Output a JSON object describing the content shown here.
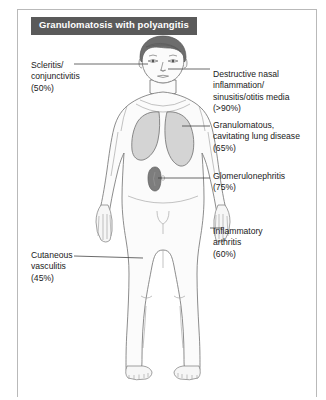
{
  "figure": {
    "title": "Granulomatosis with polyangitis",
    "accent_color": "#5a5a5a",
    "frame_color": "#b9b9b9",
    "background_color": "#ffffff"
  },
  "anatomy": {
    "figure_type": "anterior-human-body-outline",
    "skin_color": "#fbfbfb",
    "outline_color": "#6e6e6e",
    "hair_color": "#6b6b6b",
    "organs": [
      {
        "name": "lungs",
        "fill": "#d6d6d6",
        "stroke": "#6e6e6e"
      },
      {
        "name": "kidney",
        "fill": "#7d7d7d",
        "stroke": "#5e5e5e"
      }
    ]
  },
  "labels": [
    {
      "id": "scleritis",
      "name": "label-scleritis-conjunctivitis",
      "text": "Scleritis/\nconjunctivitis\n(50%)",
      "condition": "Scleritis/conjunctivitis",
      "percent": "50%",
      "side": "left",
      "target": "eyes"
    },
    {
      "id": "cutaneous",
      "name": "label-cutaneous-vasculitis",
      "text": "Cutaneous\nvasculitis\n(45%)",
      "condition": "Cutaneous vasculitis",
      "percent": "45%",
      "side": "left",
      "target": "skin-thigh"
    },
    {
      "id": "nasal",
      "name": "label-destructive-nasal-inflammation",
      "text": "Destructive nasal\ninflammation/\nsinusitis/otitis media\n(>90%)",
      "condition": "Destructive nasal inflammation/sinusitis/otitis media",
      "percent": ">90%",
      "side": "right",
      "target": "nose-sinuses"
    },
    {
      "id": "lung",
      "name": "label-granulomatous-cavitating-lung-disease",
      "text": "Granulomatous,\ncavitating lung disease\n(65%)",
      "condition": "Granulomatous, cavitating lung disease",
      "percent": "65%",
      "side": "right",
      "target": "lungs"
    },
    {
      "id": "glomerulo",
      "name": "label-glomerulonephritis",
      "text": "Glomerulonephritis\n(75%)",
      "condition": "Glomerulonephritis",
      "percent": "75%",
      "side": "right",
      "target": "kidney"
    },
    {
      "id": "arthritis",
      "name": "label-inflammatory-arthritis",
      "text": "Inflammatory\narthritis\n(60%)",
      "condition": "Inflammatory arthritis",
      "percent": "60%",
      "side": "right",
      "target": "hand-joints"
    }
  ]
}
